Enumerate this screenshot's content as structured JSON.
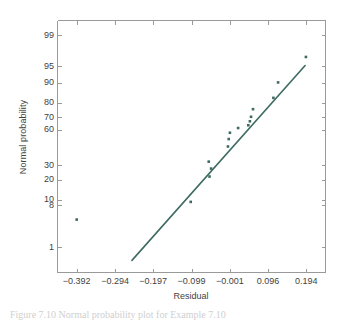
{
  "figure": {
    "caption": "Figure 7.10  Normal probability plot for Example 7.10"
  },
  "chart_data": {
    "type": "scatter",
    "title": "",
    "xlabel": "Residual",
    "ylabel": "Normal probability",
    "grid": false,
    "legend": null,
    "xlim": [
      -0.441,
      0.243
    ],
    "xticks": [
      -0.392,
      -0.294,
      -0.197,
      -0.099,
      -0.001,
      0.096,
      0.194
    ],
    "xticklabels": [
      "−0.392",
      "−0.294",
      "−0.197",
      "−0.099",
      "−0.001",
      "0.096",
      "0.194"
    ],
    "yscale": "normal-probability",
    "ylim": [
      0.2,
      99.6
    ],
    "yticks": [
      99,
      95,
      90,
      80,
      70,
      60,
      30,
      20,
      10,
      8,
      1
    ],
    "yticklabels": [
      "99",
      "95",
      "90",
      "80",
      "70",
      "60",
      "30",
      "20",
      "10",
      "8",
      "1"
    ],
    "series": [
      {
        "name": "residuals",
        "marker": "square",
        "color": "#3d6b63",
        "points": [
          {
            "x": -0.392,
            "y": 4.3
          },
          {
            "x": -0.101,
            "y": 9.2
          },
          {
            "x": -0.053,
            "y": 22.0
          },
          {
            "x": -0.049,
            "y": 27.5
          },
          {
            "x": -0.055,
            "y": 32.8
          },
          {
            "x": -0.006,
            "y": 45.5
          },
          {
            "x": -0.004,
            "y": 52.0
          },
          {
            "x": -0.001,
            "y": 57.5
          },
          {
            "x": 0.02,
            "y": 61.5
          },
          {
            "x": 0.046,
            "y": 63.8
          },
          {
            "x": 0.05,
            "y": 67.0
          },
          {
            "x": 0.053,
            "y": 70.5
          },
          {
            "x": 0.058,
            "y": 76.0
          },
          {
            "x": 0.11,
            "y": 83.0
          },
          {
            "x": 0.122,
            "y": 90.2
          },
          {
            "x": 0.193,
            "y": 96.8
          }
        ]
      }
    ],
    "reference_line": {
      "name": "normal-reference-line",
      "color": "#3d6b63",
      "x_start": -0.251,
      "y_start": 0.45,
      "x_end": 0.191,
      "y_end": 95.2
    }
  }
}
